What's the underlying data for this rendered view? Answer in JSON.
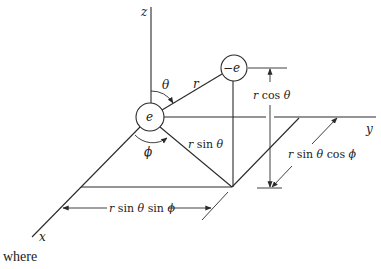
{
  "diagram": {
    "axes": {
      "z_label": "z",
      "y_label": "y",
      "x_label": "x"
    },
    "charges": {
      "positive": "e",
      "negative": "−e"
    },
    "angles": {
      "polar": "θ",
      "azimuthal": "ϕ"
    },
    "labels": {
      "r": "r",
      "r_sin_theta": "r sin θ",
      "r_cos_theta": "r cos θ",
      "r_sin_theta_cos_phi": "r sin θ cos ϕ",
      "r_sin_theta_sin_phi": "r sin θ sin ϕ"
    },
    "colors": {
      "line": "#2a2a2a",
      "background": "#ffffff"
    }
  },
  "caption": {
    "trailing_text": "where"
  }
}
